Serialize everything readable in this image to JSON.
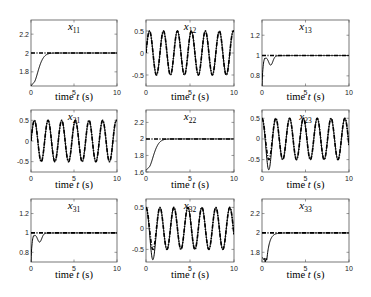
{
  "chart_data": [
    {
      "type": "line",
      "title": "x11",
      "xlabel": "time t (s)",
      "ylabel": "",
      "xlim": [
        0,
        10
      ],
      "ylim": [
        1.65,
        2.35
      ],
      "xticks": [
        0,
        5,
        10
      ],
      "yticks": [
        1.8,
        2,
        2.2
      ],
      "kind": "step",
      "ref": 2.0,
      "start": 1.65,
      "overshoot": false,
      "series": [
        {
          "name": "actual",
          "style": "solid"
        },
        {
          "name": "reference",
          "style": "dash-dot"
        }
      ]
    },
    {
      "type": "line",
      "title": "x12",
      "xlabel": "time t (s)",
      "ylabel": "",
      "xlim": [
        0,
        10
      ],
      "ylim": [
        -0.75,
        0.75
      ],
      "xticks": [
        0,
        5,
        10
      ],
      "yticks": [
        -0.5,
        0,
        0.5
      ],
      "kind": "sine",
      "amp": 0.5,
      "freq_hz": 0.63,
      "phase": 0.0,
      "series": [
        {
          "name": "actual",
          "style": "solid"
        },
        {
          "name": "reference",
          "style": "dash-dot"
        }
      ]
    },
    {
      "type": "line",
      "title": "x13",
      "xlabel": "time t (s)",
      "ylabel": "",
      "xlim": [
        0,
        10
      ],
      "ylim": [
        0.7,
        1.35
      ],
      "xticks": [
        0,
        5,
        10
      ],
      "yticks": [
        0.8,
        1,
        1.2
      ],
      "kind": "step",
      "ref": 1.0,
      "start": 0.7,
      "overshoot": true,
      "series": [
        {
          "name": "actual",
          "style": "solid"
        },
        {
          "name": "reference",
          "style": "dash-dot"
        }
      ]
    },
    {
      "type": "line",
      "title": "x21",
      "xlabel": "time t (s)",
      "ylabel": "",
      "xlim": [
        0,
        10
      ],
      "ylim": [
        -0.75,
        0.75
      ],
      "xticks": [
        0,
        5,
        10
      ],
      "yticks": [
        -0.5,
        0,
        0.5
      ],
      "kind": "sine",
      "amp": 0.5,
      "freq_hz": 0.63,
      "phase": 0.0,
      "series": [
        {
          "name": "actual",
          "style": "solid"
        },
        {
          "name": "reference",
          "style": "dash-dot"
        }
      ]
    },
    {
      "type": "line",
      "title": "x22",
      "xlabel": "time t (s)",
      "ylabel": "",
      "xlim": [
        0,
        10
      ],
      "ylim": [
        1.6,
        2.35
      ],
      "xticks": [
        0,
        5,
        10
      ],
      "yticks": [
        1.6,
        1.8,
        2,
        2.2
      ],
      "kind": "step",
      "ref": 2.0,
      "start": 1.62,
      "overshoot": false,
      "series": [
        {
          "name": "actual",
          "style": "solid"
        },
        {
          "name": "reference",
          "style": "dash-dot"
        }
      ]
    },
    {
      "type": "line",
      "title": "x23",
      "xlabel": "time t (s)",
      "ylabel": "",
      "xlim": [
        0,
        10
      ],
      "ylim": [
        -0.8,
        0.7
      ],
      "xticks": [
        0,
        5,
        10
      ],
      "yticks": [
        -0.5,
        0,
        0.5
      ],
      "kind": "sine",
      "amp": 0.5,
      "freq_hz": 0.63,
      "phase": 1.57,
      "undershoot": -0.75,
      "series": [
        {
          "name": "actual",
          "style": "solid"
        },
        {
          "name": "reference",
          "style": "dash-dot"
        }
      ]
    },
    {
      "type": "line",
      "title": "x31",
      "xlabel": "time t (s)",
      "ylabel": "",
      "xlim": [
        0,
        10
      ],
      "ylim": [
        0.7,
        1.35
      ],
      "xticks": [
        0,
        5,
        10
      ],
      "yticks": [
        0.8,
        1,
        1.2
      ],
      "kind": "step",
      "ref": 1.0,
      "start": 0.7,
      "overshoot": true,
      "series": [
        {
          "name": "actual",
          "style": "solid"
        },
        {
          "name": "reference",
          "style": "dash-dot"
        }
      ]
    },
    {
      "type": "line",
      "title": "x32",
      "xlabel": "time t (s)",
      "ylabel": "",
      "xlim": [
        0,
        10
      ],
      "ylim": [
        -0.8,
        0.7
      ],
      "xticks": [
        0,
        5,
        10
      ],
      "yticks": [
        -0.5,
        0,
        0.5
      ],
      "kind": "sine",
      "amp": 0.5,
      "freq_hz": 0.63,
      "phase": 1.57,
      "undershoot": -0.75,
      "series": [
        {
          "name": "actual",
          "style": "solid"
        },
        {
          "name": "reference",
          "style": "dash-dot"
        }
      ]
    },
    {
      "type": "line",
      "title": "x33",
      "xlabel": "time t (s)",
      "ylabel": "",
      "xlim": [
        0,
        10
      ],
      "ylim": [
        1.7,
        2.35
      ],
      "xticks": [
        0,
        5,
        10
      ],
      "yticks": [
        1.8,
        2,
        2.2
      ],
      "kind": "step",
      "ref": 2.0,
      "start": 1.75,
      "overshoot": false,
      "dip": 1.72,
      "series": [
        {
          "name": "actual",
          "style": "solid"
        },
        {
          "name": "reference",
          "style": "dash-dot"
        }
      ]
    }
  ],
  "layout": {
    "cols": [
      {
        "x0": 31,
        "x1": 117
      },
      {
        "x0": 146,
        "x1": 234
      },
      {
        "x0": 262,
        "x1": 349
      }
    ],
    "rows": [
      {
        "y0": 20,
        "y1": 86,
        "xlabel_y": 100
      },
      {
        "y0": 110,
        "y1": 172,
        "xlabel_y": 188
      },
      {
        "y0": 199,
        "y1": 262,
        "xlabel_y": 278
      }
    ]
  }
}
